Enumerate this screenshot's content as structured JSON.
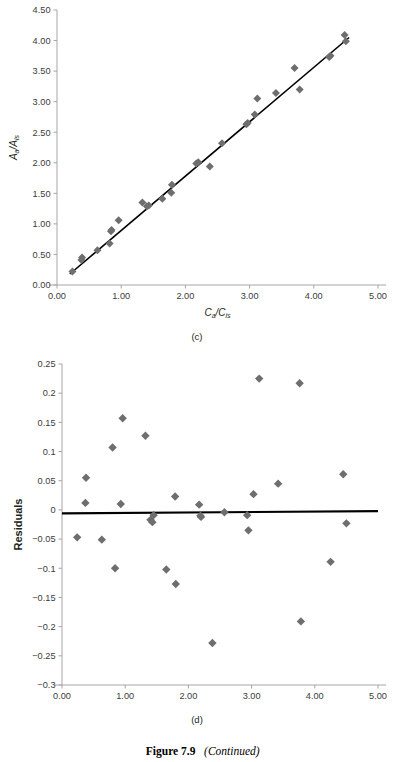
{
  "figure": {
    "caption_number": "Figure 7.9",
    "caption_continued": "(Continued)",
    "panel_c_label": "(c)",
    "panel_d_label": "(d)",
    "marker_color": "#6e6e6e",
    "line_color": "#000000",
    "axis_color": "#a6a6a6",
    "text_color": "#231f20"
  },
  "chart_data": [
    {
      "id": "panel-c",
      "type": "scatter",
      "title": "",
      "panel": "(c)",
      "xlabel": "Ca/Cis",
      "xlabel_parts": {
        "num": "C",
        "num_sub": "a",
        "den": "C",
        "den_sub": "is"
      },
      "ylabel": "Aa/Ais",
      "ylabel_parts": {
        "num": "A",
        "num_sub": "a",
        "den": "A",
        "den_sub": "is"
      },
      "xlim": [
        0.0,
        5.0
      ],
      "ylim": [
        0.0,
        4.5
      ],
      "xticks": [
        0.0,
        1.0,
        2.0,
        3.0,
        4.0,
        5.0
      ],
      "xtick_labels": [
        "0.00",
        "1.00",
        "2.00",
        "3.00",
        "4.00",
        "5.00"
      ],
      "yticks": [
        0.0,
        0.5,
        1.0,
        1.5,
        2.0,
        2.5,
        3.0,
        3.5,
        4.0,
        4.5
      ],
      "ytick_labels": [
        "0.00",
        "0.50",
        "1.00",
        "1.50",
        "2.00",
        "2.50",
        "3.00",
        "3.50",
        "4.00",
        "4.50"
      ],
      "grid": false,
      "legend": "none",
      "series": [
        {
          "name": "Calibration points",
          "marker": "diamond",
          "color": "#6e6e6e",
          "x": [
            0.24,
            0.38,
            0.39,
            0.63,
            0.82,
            0.84,
            0.85,
            0.96,
            1.33,
            1.4,
            1.43,
            1.64,
            1.78,
            1.79,
            2.17,
            2.2,
            2.38,
            2.57,
            2.95,
            2.97,
            3.08,
            3.12,
            3.41,
            3.7,
            3.78,
            4.24,
            4.26,
            4.48,
            4.5
          ],
          "y": [
            0.22,
            0.41,
            0.45,
            0.57,
            0.68,
            0.88,
            0.9,
            1.06,
            1.35,
            1.29,
            1.3,
            1.41,
            1.51,
            1.64,
            1.99,
            2.01,
            1.94,
            2.32,
            2.63,
            2.65,
            2.79,
            3.05,
            3.14,
            3.55,
            3.2,
            3.73,
            3.75,
            4.09,
            3.99
          ]
        }
      ],
      "fit_line": {
        "name": "Least-squares regression line",
        "color": "#000000",
        "x": [
          0.2,
          4.55
        ],
        "y": [
          0.18,
          4.05
        ]
      }
    },
    {
      "id": "panel-d",
      "type": "scatter",
      "title": "",
      "panel": "(d)",
      "xlabel": "",
      "ylabel": "Residuals",
      "xlim": [
        0.0,
        5.0
      ],
      "ylim": [
        -0.3,
        0.25
      ],
      "xticks": [
        0.0,
        1.0,
        2.0,
        3.0,
        4.0,
        5.0
      ],
      "xtick_labels": [
        "0.00",
        "1.00",
        "2.00",
        "3.00",
        "4.00",
        "5.00"
      ],
      "yticks": [
        0.25,
        0.2,
        0.15,
        0.1,
        0.05,
        0,
        -0.05,
        -0.1,
        -0.15,
        -0.2,
        -0.25,
        -0.3
      ],
      "ytick_labels": [
        "0.25",
        "0.2",
        "0.15",
        "0.1",
        "0.05",
        "0",
        "−0.05",
        "−0.1",
        "−0.15",
        "−0.2",
        "−0.25",
        "−0.3"
      ],
      "grid": false,
      "legend": "none",
      "series": [
        {
          "name": "Residuals",
          "marker": "diamond",
          "color": "#6e6e6e",
          "x": [
            0.24,
            0.37,
            0.38,
            0.63,
            0.8,
            0.84,
            0.93,
            0.96,
            1.32,
            1.4,
            1.43,
            1.45,
            1.65,
            1.79,
            1.8,
            2.17,
            2.19,
            2.2,
            2.38,
            2.57,
            2.93,
            2.95,
            3.03,
            3.12,
            3.42,
            3.76,
            3.78,
            4.25,
            4.45,
            4.5
          ],
          "y": [
            -0.047,
            0.012,
            0.055,
            -0.051,
            0.107,
            -0.1,
            0.01,
            0.157,
            0.127,
            -0.017,
            -0.021,
            -0.009,
            -0.102,
            0.023,
            -0.127,
            0.009,
            -0.01,
            -0.012,
            -0.228,
            -0.004,
            -0.009,
            -0.035,
            0.027,
            0.225,
            0.045,
            0.217,
            -0.191,
            -0.089,
            0.061,
            -0.023
          ]
        }
      ],
      "fit_line": {
        "name": "Zero-residual trend line",
        "color": "#000000",
        "x": [
          0.0,
          5.0
        ],
        "y": [
          -0.006,
          -0.002
        ]
      }
    }
  ]
}
